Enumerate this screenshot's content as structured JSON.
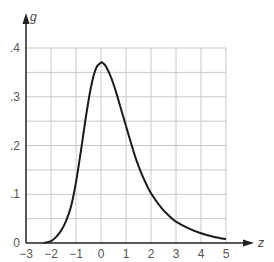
{
  "chart_data": {
    "type": "line",
    "title": "",
    "xlabel": "z",
    "ylabel": "g",
    "xlim": [
      -3,
      5
    ],
    "ylim": [
      0,
      0.4
    ],
    "grid": true,
    "x_ticks": [
      "−3",
      "−2",
      "−1",
      "0",
      "1",
      "2",
      "3",
      "4",
      "5"
    ],
    "y_ticks": [
      "0",
      ".1",
      ".2",
      ".3",
      ".4"
    ],
    "series": [
      {
        "name": "g(z)",
        "x": [
          -2.3,
          -2.0,
          -1.8,
          -1.6,
          -1.4,
          -1.2,
          -1.0,
          -0.8,
          -0.6,
          -0.4,
          -0.2,
          0.0,
          0.1,
          0.2,
          0.4,
          0.6,
          0.8,
          1.0,
          1.2,
          1.4,
          1.6,
          1.8,
          2.0,
          2.4,
          2.8,
          3.0,
          3.5,
          4.0,
          4.5,
          5.0
        ],
        "y": [
          0.0,
          0.004,
          0.012,
          0.025,
          0.045,
          0.075,
          0.125,
          0.19,
          0.26,
          0.32,
          0.358,
          0.37,
          0.368,
          0.362,
          0.34,
          0.31,
          0.275,
          0.24,
          0.205,
          0.172,
          0.145,
          0.122,
          0.102,
          0.073,
          0.052,
          0.044,
          0.03,
          0.02,
          0.013,
          0.008
        ]
      }
    ]
  }
}
